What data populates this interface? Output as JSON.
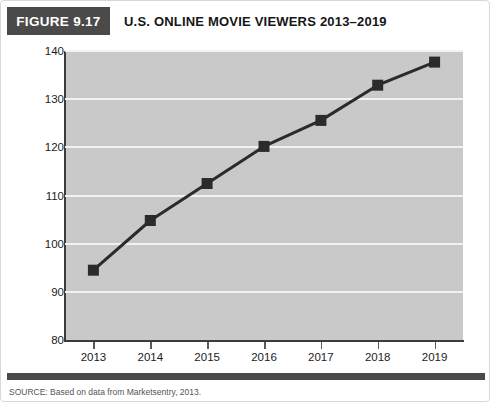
{
  "figure": {
    "tag": "FIGURE 9.17",
    "title": "U.S. ONLINE MOVIE VIEWERS 2013–2019",
    "source": "SOURCE: Based on data from Marketsentry, 2013."
  },
  "colors": {
    "tag_background": "#4a4a4a",
    "tag_text": "#ffffff",
    "plot_background": "#c9c9c9",
    "gridline": "#f2f2f2",
    "axis": "#3c3c3c",
    "series_line": "#2b2b2b",
    "marker": "#2b2b2b",
    "card_background": "#ffffff"
  },
  "chart_data": {
    "type": "line",
    "title": "U.S. ONLINE MOVIE VIEWERS 2013–2019",
    "xlabel": "",
    "ylabel": "",
    "categories": [
      "2013",
      "2014",
      "2015",
      "2016",
      "2017",
      "2018",
      "2019"
    ],
    "x": [
      2013,
      2014,
      2015,
      2016,
      2017,
      2018,
      2019
    ],
    "values": [
      94.5,
      104.8,
      112.5,
      120.2,
      125.6,
      132.9,
      137.7
    ],
    "series": [
      {
        "name": "U.S. online movie viewers (millions)",
        "values": [
          94.5,
          104.8,
          112.5,
          120.2,
          125.6,
          132.9,
          137.7
        ]
      }
    ],
    "ylim": [
      80,
      140
    ],
    "yticks": [
      80,
      90,
      100,
      110,
      120,
      130,
      140
    ],
    "ytick_labels": [
      "80",
      "90",
      "100",
      "110",
      "120",
      "130",
      "140"
    ],
    "xtick_labels": [
      "2013",
      "2014",
      "2015",
      "2016",
      "2017",
      "2018",
      "2019"
    ],
    "grid": true,
    "grid_axis": "y",
    "legend": false,
    "legend_position": "none",
    "marker": "square",
    "annotations": []
  }
}
